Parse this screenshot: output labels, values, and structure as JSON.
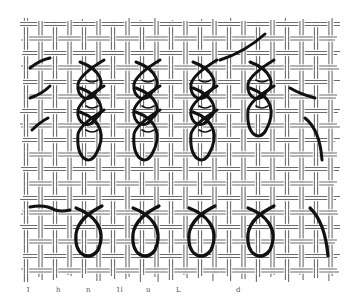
{
  "figure": {
    "description": "Needlework stitch diagram on canvas mesh",
    "colors": {
      "background": "#ffffff",
      "canvas_thread": "#6d6d6d",
      "working_thread": "#111111"
    },
    "upper_row": {
      "stitch": "twisted chain stitch",
      "columns": 4,
      "completed_links_per_column": [
        3,
        3,
        3,
        2
      ]
    },
    "lower_row": {
      "stitch": "detached chain stitch",
      "count": 4,
      "partial_stitch": true
    },
    "margin_labels": [
      "1",
      "h",
      "n",
      "1l",
      "u",
      "L",
      "",
      "d",
      "",
      "",
      ""
    ]
  }
}
